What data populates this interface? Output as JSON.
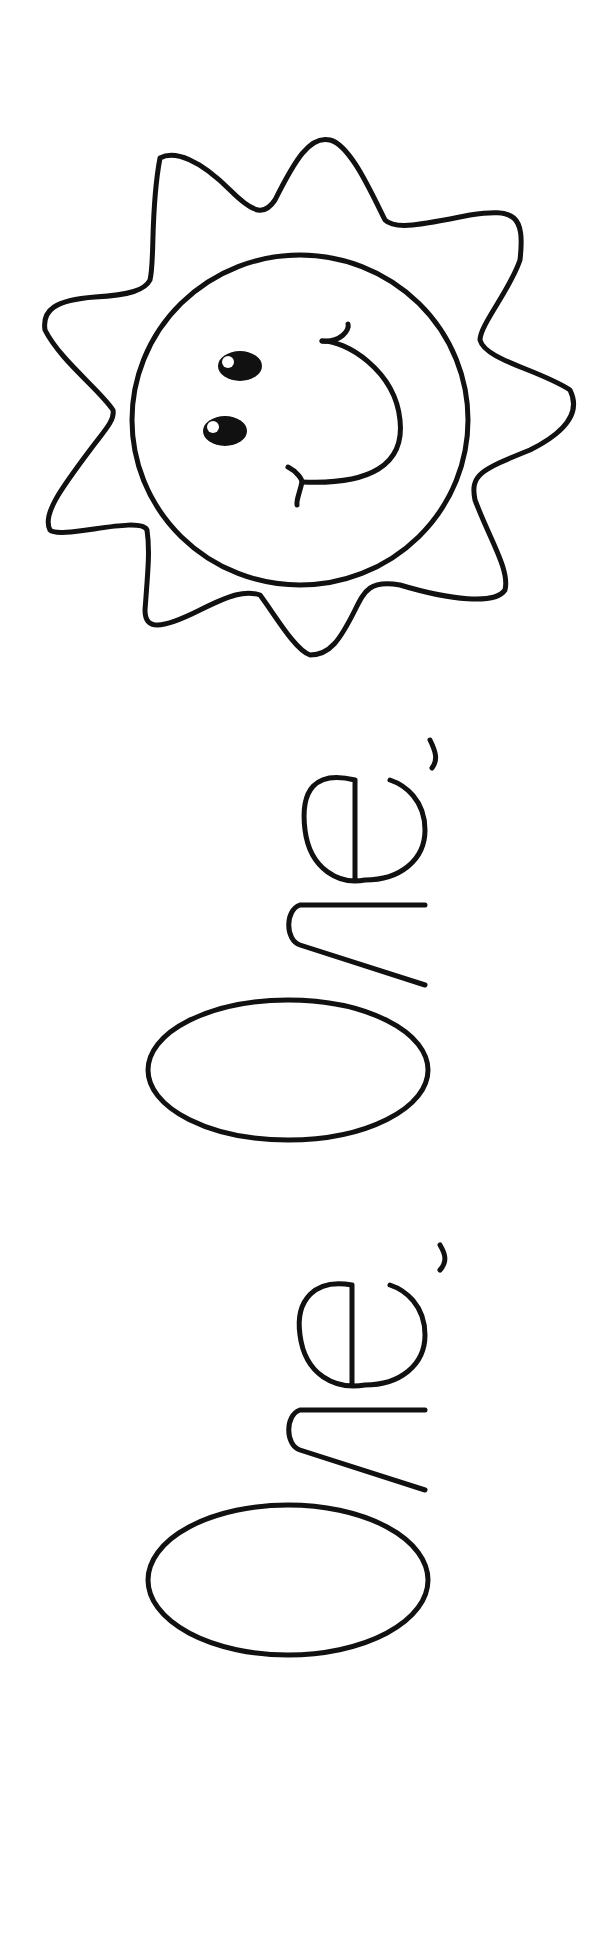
{
  "illustration": {
    "subject": "smiling sun",
    "stroke_color": "#111111",
    "background": "#ffffff"
  },
  "caption": {
    "text": "One, One,",
    "orientation": "rotated 90° counter-clockwise, reads bottom-to-top"
  }
}
